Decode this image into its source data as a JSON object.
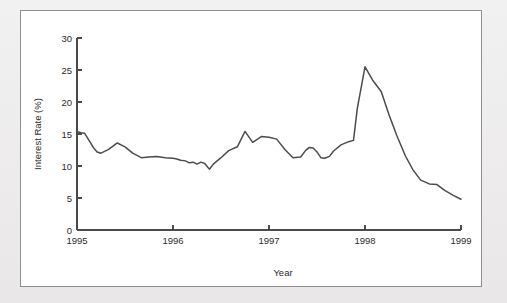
{
  "figure": {
    "panel_background": "#ffffff",
    "page_background": "#eceaea",
    "border_color": "#8e8e8e"
  },
  "chart_data": {
    "type": "line",
    "title": "",
    "xlabel": "Year",
    "ylabel": "Interest Rate (%)",
    "xlim": [
      1995,
      1999
    ],
    "ylim": [
      0,
      30
    ],
    "xticks": [
      1995,
      1996,
      1997,
      1998,
      1999
    ],
    "xtick_labels": [
      "1995",
      "1996",
      "1997",
      "1998",
      "1999"
    ],
    "yticks": [
      0,
      5,
      10,
      15,
      20,
      25,
      30
    ],
    "ytick_labels": [
      "0",
      "5",
      "10",
      "15",
      "20",
      "25",
      "30"
    ],
    "grid": false,
    "legend": false,
    "line_color": "#4c4c4c",
    "series": [
      {
        "name": "Interest Rate",
        "x": [
          1995.0,
          1995.04,
          1995.08,
          1995.13,
          1995.17,
          1995.21,
          1995.25,
          1995.33,
          1995.42,
          1995.5,
          1995.58,
          1995.67,
          1995.75,
          1995.83,
          1995.92,
          1996.0,
          1996.04,
          1996.08,
          1996.13,
          1996.17,
          1996.21,
          1996.25,
          1996.29,
          1996.33,
          1996.38,
          1996.42,
          1996.5,
          1996.58,
          1996.67,
          1996.75,
          1996.83,
          1996.92,
          1997.0,
          1997.08,
          1997.17,
          1997.25,
          1997.33,
          1997.38,
          1997.42,
          1997.46,
          1997.5,
          1997.54,
          1997.58,
          1997.63,
          1997.67,
          1997.75,
          1997.83,
          1997.88,
          1997.92,
          1998.0,
          1998.08,
          1998.17,
          1998.25,
          1998.33,
          1998.42,
          1998.5,
          1998.58,
          1998.67,
          1998.75,
          1998.83,
          1998.92,
          1999.0
        ],
        "y": [
          15.4,
          15.2,
          15.1,
          13.9,
          12.9,
          12.2,
          12.0,
          12.6,
          13.6,
          13.0,
          12.0,
          11.3,
          11.4,
          11.5,
          11.3,
          11.2,
          11.1,
          10.9,
          10.8,
          10.5,
          10.6,
          10.3,
          10.6,
          10.4,
          9.5,
          10.3,
          11.3,
          12.4,
          13.0,
          15.4,
          13.7,
          14.6,
          14.5,
          14.2,
          12.5,
          11.3,
          11.4,
          12.4,
          12.9,
          12.8,
          12.2,
          11.3,
          11.2,
          11.5,
          12.3,
          13.3,
          13.8,
          14.0,
          19.0,
          25.5,
          23.4,
          21.6,
          18.0,
          14.8,
          11.6,
          9.4,
          7.8,
          7.2,
          7.1,
          6.2,
          5.4,
          4.8
        ]
      }
    ],
    "annotations": [],
    "notes": {
      "peak_value": 25.5,
      "peak_year": 1998.0,
      "start_value": 15.4,
      "end_value": 4.8,
      "min_value": 4.8
    }
  }
}
